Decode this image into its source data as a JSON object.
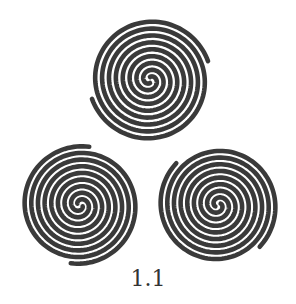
{
  "figure": {
    "caption": "1.1",
    "stroke_color": "#3a3a3a",
    "background": "#ffffff",
    "spirals": [
      {
        "name": "top",
        "cx": 150,
        "cy": 80,
        "r": 64
      },
      {
        "name": "bottom-left",
        "cx": 80,
        "cy": 205,
        "r": 62
      },
      {
        "name": "bottom-right",
        "cx": 218,
        "cy": 205,
        "r": 62
      }
    ]
  }
}
